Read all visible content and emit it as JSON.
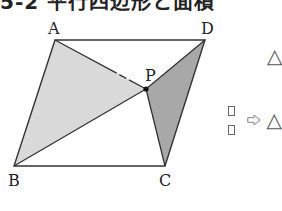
{
  "title": "5-2 平行四辺形と面積",
  "figure": {
    "vertices": {
      "A": {
        "label": "A",
        "x": 55,
        "y": 40
      },
      "D": {
        "label": "D",
        "x": 205,
        "y": 40
      },
      "B": {
        "label": "B",
        "x": 14,
        "y": 166
      },
      "C": {
        "label": "C",
        "x": 165,
        "y": 166
      },
      "P": {
        "label": "P",
        "x": 146,
        "y": 89
      }
    },
    "shaded": [
      {
        "name": "triangle-ABP",
        "fill": "#d9d9d9"
      },
      {
        "name": "triangle-DPC",
        "fill": "#a8a8a8"
      }
    ],
    "stroke": "#333333"
  },
  "side": {
    "triangle_symbol_1": "△",
    "triangle_symbol_2": "△",
    "arrow": "⇨"
  }
}
